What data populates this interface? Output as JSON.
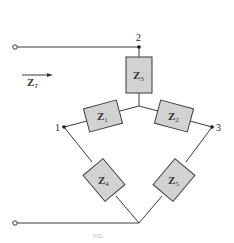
{
  "diagram": {
    "type": "bridge-network-impedance",
    "nodes": [
      {
        "id": "1",
        "label": "1"
      },
      {
        "id": "2",
        "label": "2"
      },
      {
        "id": "3",
        "label": "3"
      }
    ],
    "impedances": [
      {
        "id": "Z1",
        "main": "Z",
        "sub": "1"
      },
      {
        "id": "Z2",
        "main": "Z",
        "sub": "2"
      },
      {
        "id": "Z3",
        "main": "Z",
        "sub": "3"
      },
      {
        "id": "Z4",
        "main": "Z",
        "sub": "4"
      },
      {
        "id": "Z5",
        "main": "Z",
        "sub": "5"
      }
    ],
    "input_label": {
      "main": "Z",
      "sub": "T"
    },
    "caption": "FIG."
  }
}
